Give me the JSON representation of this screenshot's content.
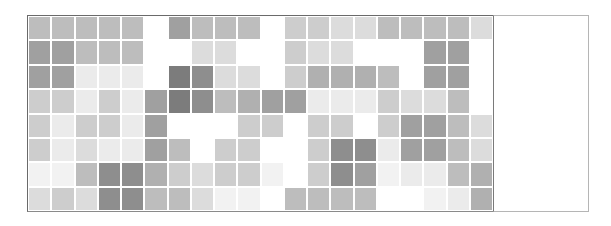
{
  "board": {
    "rows": 8,
    "cols": 20,
    "palette": {
      "0": "#ffffff",
      "0.3": "#f2f2f2",
      "0.5": "#ebebeb",
      "1": "#dcdcdc",
      "1.5": "#cdcdcd",
      "2": "#bdbdbd",
      "2.5": "#b0b0b0",
      "3": "#a0a0a0",
      "3.5": "#8e8e8e",
      "4": "#7c7c7c"
    },
    "cells": [
      [
        2,
        2,
        2,
        2,
        2,
        0,
        3,
        2,
        2,
        2,
        0,
        1.5,
        1.5,
        1,
        1,
        2,
        2,
        2,
        2,
        1
      ],
      [
        3,
        3,
        2,
        2,
        2,
        0,
        0,
        1,
        1,
        0,
        0,
        1.5,
        1,
        1,
        0,
        0,
        0,
        3,
        3,
        0
      ],
      [
        3,
        3,
        0.5,
        0.5,
        0.5,
        0,
        4,
        3.5,
        1,
        1,
        0,
        1.5,
        2.5,
        2.5,
        2.5,
        2,
        0,
        3,
        3,
        0
      ],
      [
        1.5,
        1.5,
        0.5,
        1.5,
        0.5,
        3,
        4,
        3.5,
        2,
        2.5,
        3,
        3,
        0.5,
        0.5,
        0.5,
        1.5,
        1,
        1,
        2,
        0
      ],
      [
        1.5,
        0.5,
        1.5,
        1.5,
        0.5,
        3,
        0,
        0,
        0,
        1.5,
        1.5,
        0,
        1.5,
        1.5,
        0,
        1.5,
        3,
        3,
        2,
        1
      ],
      [
        1.5,
        0.5,
        1,
        0.5,
        0.5,
        3,
        2,
        0,
        1.5,
        1.5,
        0,
        0,
        1.5,
        3.5,
        3.5,
        0.5,
        3,
        3,
        2,
        1
      ],
      [
        0.3,
        0.3,
        2,
        3.5,
        3.5,
        2.5,
        1.5,
        1,
        1.5,
        1.5,
        0.3,
        0,
        1.5,
        3.5,
        3,
        0.3,
        0.5,
        0.5,
        2,
        2.5
      ],
      [
        1,
        1.5,
        1,
        3.5,
        3.5,
        2,
        2,
        1,
        0.3,
        0.3,
        0,
        2,
        2,
        2,
        2,
        0,
        0,
        0.3,
        0.5,
        2.5
      ]
    ]
  },
  "side_panel": {
    "content": ""
  }
}
